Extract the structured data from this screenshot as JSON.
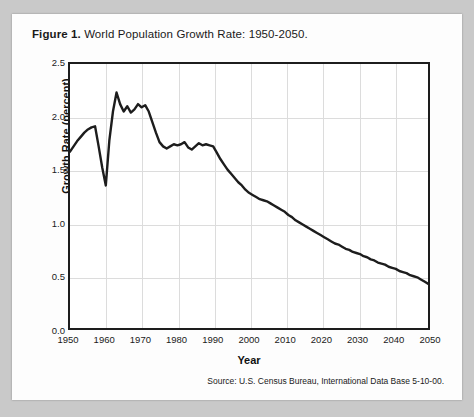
{
  "figure": {
    "label": "Figure 1.",
    "caption": "World Population Growth Rate: 1950-2050.",
    "source": "Source: U.S. Census Bureau, International Data Base 5-10-00."
  },
  "style": {
    "page_background": "#c9c9c9",
    "card_background": "#fdfdfd",
    "plot_background": "#ffffff",
    "line_color": "#1d1d1d",
    "grid_color": "#dcdcdc",
    "axis_color": "#1d1d1d"
  },
  "chart_data": {
    "type": "line",
    "title": "World Population Growth Rate: 1950-2050",
    "xlabel": "Year",
    "ylabel": "Growth Rate (percent)",
    "xlim": [
      1950,
      2050
    ],
    "ylim": [
      0.0,
      2.5
    ],
    "xticks": [
      1950,
      1960,
      1970,
      1980,
      1990,
      2000,
      2010,
      2020,
      2030,
      2040,
      2050
    ],
    "yticks": [
      0.0,
      0.5,
      1.0,
      1.5,
      2.0,
      2.5
    ],
    "grid": true,
    "legend": "none",
    "series": [
      {
        "name": "World population growth rate",
        "x": [
          1950,
          1951,
          1952,
          1953,
          1954,
          1955,
          1956,
          1957,
          1958,
          1959,
          1960,
          1961,
          1962,
          1963,
          1964,
          1965,
          1966,
          1967,
          1968,
          1969,
          1970,
          1971,
          1972,
          1973,
          1974,
          1975,
          1976,
          1977,
          1978,
          1979,
          1980,
          1981,
          1982,
          1983,
          1984,
          1985,
          1986,
          1987,
          1988,
          1989,
          1990,
          1991,
          1992,
          1993,
          1994,
          1995,
          1996,
          1997,
          1998,
          1999,
          2000,
          2001,
          2002,
          2003,
          2004,
          2005,
          2006,
          2007,
          2008,
          2009,
          2010,
          2011,
          2012,
          2013,
          2014,
          2015,
          2016,
          2017,
          2018,
          2019,
          2020,
          2021,
          2022,
          2023,
          2024,
          2025,
          2026,
          2027,
          2028,
          2029,
          2030,
          2031,
          2032,
          2033,
          2034,
          2035,
          2036,
          2037,
          2038,
          2039,
          2040,
          2041,
          2042,
          2043,
          2044,
          2045,
          2046,
          2047,
          2048,
          2049,
          2050
        ],
        "values": [
          1.67,
          1.72,
          1.77,
          1.81,
          1.85,
          1.88,
          1.9,
          1.91,
          1.72,
          1.52,
          1.35,
          1.78,
          2.05,
          2.23,
          2.12,
          2.05,
          2.1,
          2.04,
          2.07,
          2.12,
          2.09,
          2.11,
          2.05,
          1.95,
          1.85,
          1.76,
          1.72,
          1.7,
          1.72,
          1.74,
          1.73,
          1.74,
          1.76,
          1.71,
          1.69,
          1.72,
          1.75,
          1.73,
          1.74,
          1.73,
          1.72,
          1.66,
          1.6,
          1.55,
          1.5,
          1.46,
          1.42,
          1.38,
          1.35,
          1.31,
          1.28,
          1.26,
          1.24,
          1.22,
          1.21,
          1.2,
          1.18,
          1.16,
          1.14,
          1.12,
          1.1,
          1.07,
          1.05,
          1.02,
          1.0,
          0.98,
          0.96,
          0.94,
          0.92,
          0.9,
          0.88,
          0.86,
          0.84,
          0.82,
          0.8,
          0.79,
          0.77,
          0.75,
          0.74,
          0.72,
          0.71,
          0.7,
          0.68,
          0.67,
          0.65,
          0.64,
          0.62,
          0.61,
          0.6,
          0.58,
          0.57,
          0.56,
          0.54,
          0.53,
          0.52,
          0.5,
          0.49,
          0.48,
          0.46,
          0.44,
          0.42
        ]
      }
    ]
  }
}
